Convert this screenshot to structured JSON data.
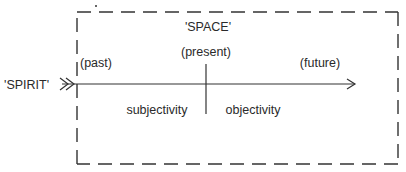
{
  "diagram": {
    "space_label": "'SPACE'",
    "spirit_label": "'SPIRIT'",
    "past_label": "(past)",
    "present_label": "(present)",
    "future_label": "(future)",
    "subjectivity_label": "subjectivity",
    "objectivity_label": "objectivity"
  }
}
